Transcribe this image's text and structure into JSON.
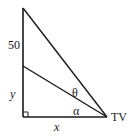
{
  "diagram": {
    "type": "right-triangle-angle-of-elevation",
    "stroke_color": "#1a1a1a",
    "background": "#ffffff",
    "points": {
      "top": {
        "x": 23,
        "y": 8
      },
      "middle": {
        "x": 23,
        "y": 66
      },
      "corner": {
        "x": 23,
        "y": 117
      },
      "tv": {
        "x": 107,
        "y": 117
      }
    },
    "labels": {
      "upper_segment": "50",
      "lower_segment": "y",
      "base": "x",
      "angle_upper": "θ",
      "angle_lower": "α",
      "vertex": "TV"
    },
    "right_angle_marker": true
  }
}
